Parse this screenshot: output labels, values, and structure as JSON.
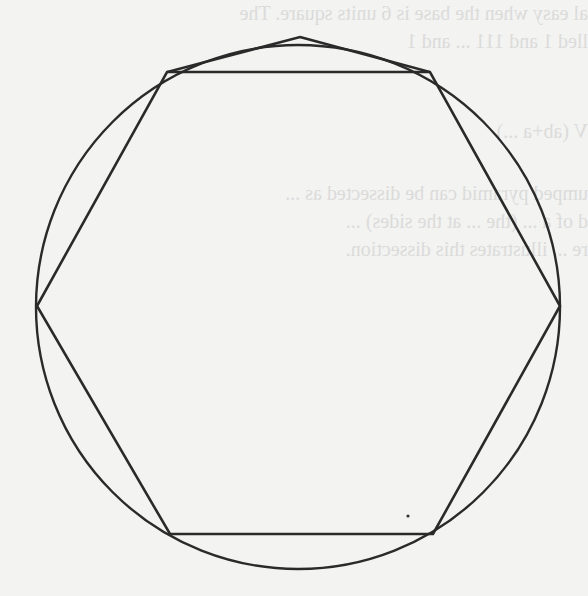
{
  "figure": {
    "type": "geometric-diagram",
    "stroke_color": "#2a2a2a",
    "background_color": "#f3f3f2",
    "circle": {
      "cx": 298,
      "cy": 307,
      "r": 262
    },
    "polygon_points": [
      [
        300,
        37
      ],
      [
        430,
        72
      ],
      [
        560,
        306
      ],
      [
        433,
        534
      ],
      [
        170,
        534
      ],
      [
        37,
        306
      ],
      [
        167,
        72
      ]
    ],
    "chord": [
      [
        167,
        72
      ],
      [
        430,
        72
      ]
    ]
  },
  "bleed_through_text": {
    "line1": "al easy when the base is 6 units square. The",
    "line2": "lled 1 and 111 ... and 1",
    "line3": "V (ab+a ...)",
    "line4": "umped pyramid can be dissected as ...",
    "line5": "d of a ... (the ... at the sides) ...",
    "line6": "re ... illustrates this dissection."
  }
}
